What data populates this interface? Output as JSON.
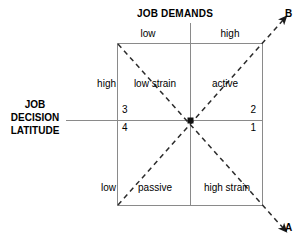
{
  "diagram": {
    "title": "JOB DEMANDS",
    "vertical_axis_label": "JOB\nDECISION\nLATITUDE",
    "vertical_axis_line1": "JOB",
    "vertical_axis_line2": "DECISION",
    "vertical_axis_line3": "LATITUDE",
    "demand_levels": {
      "low": "low",
      "high": "high"
    },
    "latitude_levels": {
      "high": "high",
      "low": "low"
    },
    "quadrant_labels": {
      "top_left": "low strain",
      "top_right": "active",
      "bottom_left": "passive",
      "bottom_right": "high strain"
    },
    "quadrant_numbers": {
      "top_left": "3",
      "bottom_left": "4",
      "top_right": "2",
      "bottom_right": "1"
    },
    "diagonal_arrows": {
      "up_right": "B",
      "down_right": "A"
    },
    "colors": {
      "line": "#808080",
      "dashed": "#404040",
      "text": "#000000",
      "background": "#ffffff"
    }
  }
}
